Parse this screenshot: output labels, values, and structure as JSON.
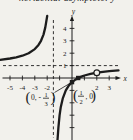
{
  "caption": {
    "text": "horizontal asymptote: y"
  },
  "colors": {
    "ink": "#1c1c1c",
    "paper": "#f2f1ec"
  },
  "labels": {
    "y_intercept": {
      "open": "(",
      "pre": "0, -",
      "num": "1",
      "den": "3",
      "close": ")"
    },
    "x_intercept": {
      "open": "(",
      "num": "1",
      "den": "2",
      "post": ", 0",
      "close": ")"
    }
  },
  "chart_data": {
    "type": "line",
    "title": "",
    "xlabel": "x",
    "ylabel": "y",
    "xlim": [
      -5.8,
      3.8
    ],
    "ylim": [
      -5,
      4.8
    ],
    "grid": false,
    "vertical_asymptote_x": -1.5,
    "horizontal_asymptote_y": 1,
    "x_ticks": [
      -5,
      -4,
      -3,
      -2,
      -1,
      1,
      2,
      3
    ],
    "x_tick_labels": [
      {
        "v": -5,
        "t": "-5"
      },
      {
        "v": -4,
        "t": "-4"
      },
      {
        "v": -3,
        "t": "-3"
      },
      {
        "v": -2,
        "t": "-2"
      },
      {
        "v": 2,
        "t": "2"
      },
      {
        "v": 3,
        "t": "3"
      }
    ],
    "y_ticks": [
      -4,
      -3,
      -2,
      -1,
      1,
      2,
      3,
      4
    ],
    "y_tick_labels": [
      {
        "v": 1,
        "t": "1"
      },
      {
        "v": 2,
        "t": "2"
      },
      {
        "v": 3,
        "t": "3"
      },
      {
        "v": 4,
        "t": "4"
      }
    ],
    "series": [
      {
        "name": "left-branch",
        "points": [
          [
            -5.8,
            1.47
          ],
          [
            -5,
            1.57
          ],
          [
            -4.5,
            1.67
          ],
          [
            -4,
            1.8
          ],
          [
            -3.5,
            2.0
          ],
          [
            -3,
            2.33
          ],
          [
            -2.7,
            2.67
          ],
          [
            -2.5,
            3.0
          ],
          [
            -2.3,
            3.5
          ],
          [
            -2.15,
            4.08
          ],
          [
            -2.0,
            5.0
          ]
        ]
      },
      {
        "name": "right-branch",
        "points": [
          [
            -1.17,
            -5.0
          ],
          [
            -1.1,
            -4.0
          ],
          [
            -1,
            -3.0
          ],
          [
            -0.9,
            -2.33
          ],
          [
            -0.75,
            -1.67
          ],
          [
            -0.5,
            -1.0
          ],
          [
            -0.25,
            -0.6
          ],
          [
            0,
            -0.333
          ],
          [
            0.25,
            -0.143
          ],
          [
            0.5,
            0
          ],
          [
            0.75,
            0.111
          ],
          [
            1,
            0.2
          ],
          [
            1.5,
            0.333
          ],
          [
            2,
            0.429
          ],
          [
            2.5,
            0.5
          ],
          [
            3,
            0.556
          ],
          [
            3.5,
            0.6
          ],
          [
            3.75,
            0.619
          ]
        ]
      }
    ],
    "markers": [
      {
        "x": 0,
        "y": -0.333,
        "type": "filled",
        "label": "(0, -1/3)"
      },
      {
        "x": 0.5,
        "y": 0,
        "type": "filled",
        "label": "(1/2, 0)"
      },
      {
        "x": 2,
        "y": 0.429,
        "type": "open",
        "label": ""
      }
    ]
  }
}
